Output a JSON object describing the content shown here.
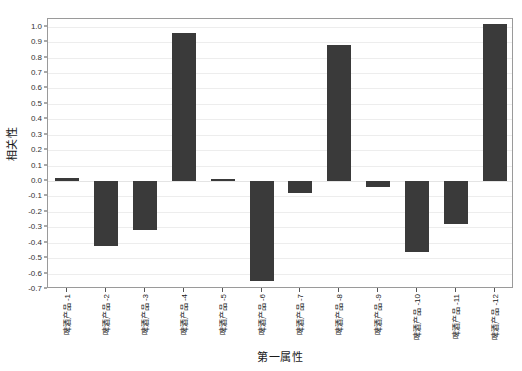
{
  "chart_data": {
    "type": "bar",
    "title": "",
    "xlabel": "第一属性",
    "ylabel": "相关性",
    "categories": [
      "啤酒产品 -1",
      "啤酒产品 -2",
      "啤酒产品 -3",
      "啤酒产品 -4",
      "啤酒产品 -5",
      "啤酒产品 -6",
      "啤酒产品 -7",
      "啤酒产品 -8",
      "啤酒产品 -9",
      "啤酒产品 -10",
      "啤酒产品 -11",
      "啤酒产品 -12"
    ],
    "values": [
      0.02,
      -0.42,
      -0.32,
      0.96,
      0.01,
      -0.65,
      -0.08,
      0.88,
      -0.04,
      -0.46,
      -0.28,
      1.02
    ],
    "ylim": [
      -0.7,
      1.05
    ],
    "ytick_values": [
      1.0,
      0.9,
      0.8,
      0.7,
      0.6,
      0.5,
      0.4,
      0.3,
      0.2,
      0.1,
      0.0,
      -0.1,
      -0.2,
      -0.3,
      -0.4,
      -0.5,
      -0.6,
      -0.7
    ],
    "ytick_labels": [
      "1.0",
      "0.9",
      "0.8",
      "0.7",
      "0.6",
      "0.5",
      "0.4",
      "0.3",
      "0.2",
      "0.1",
      "0.0",
      "-0.1",
      "-0.2",
      "-0.3",
      "-0.4",
      "-0.5",
      "-0.6",
      "-0.7"
    ],
    "grid": true,
    "legend": null,
    "bar_color": "#3a3a3a",
    "grid_color": "#ededed",
    "background_color": "#ffffff",
    "frame_color": "#9a9a9a"
  }
}
